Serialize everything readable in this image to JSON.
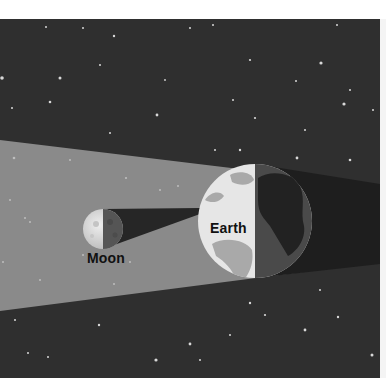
{
  "diagram": {
    "type": "lunar-eclipse-illustration",
    "labels": {
      "earth": "Earth",
      "moon": "Moon"
    },
    "colors": {
      "space": "#2f2f2f",
      "sunlight_band": "#8a8a8a",
      "earth_shadow": "#1e1e1e",
      "earth_day": "#e6e6e6",
      "earth_land_day": "#a9a9a9",
      "earth_night": "#4a4a4a",
      "earth_land_night": "#222222",
      "moon_lit": "#dcdcdc",
      "moon_dark": "#555555",
      "border": "#ffffff"
    }
  }
}
